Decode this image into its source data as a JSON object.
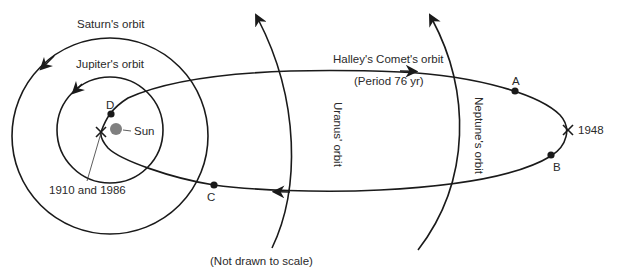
{
  "diagram": {
    "note": "(Not drawn to scale)",
    "colors": {
      "line": "#1a1a1a",
      "sun": "#808080",
      "text": "#2a2a2a",
      "background": "#ffffff"
    },
    "labels": {
      "saturn": "Saturn's orbit",
      "jupiter": "Jupiter's orbit",
      "uranus": "Uranus' orbit",
      "neptune": "Neptune's orbit",
      "comet": "Halley's Comet's orbit",
      "period": "(Period 76 yr)",
      "sun": "Sun",
      "perihelion_years": "1910 and 1986",
      "aphelion_year": "1948"
    },
    "points": [
      {
        "id": "A",
        "label": "A"
      },
      {
        "id": "B",
        "label": "B"
      },
      {
        "id": "C",
        "label": "C"
      },
      {
        "id": "D",
        "label": "D"
      }
    ]
  }
}
